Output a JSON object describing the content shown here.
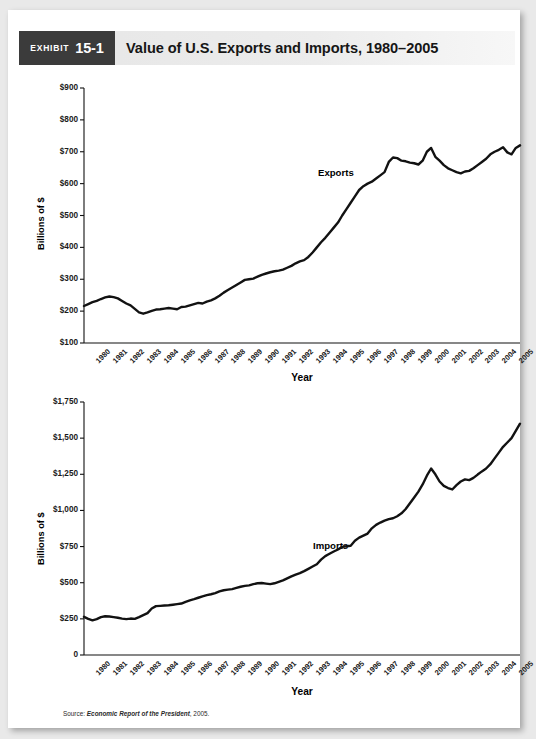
{
  "header": {
    "exhibit_word": "Exhibit",
    "exhibit_number": "15-1",
    "title": "Value of U.S. Exports and Imports, 1980–2005"
  },
  "source": {
    "prefix": "Source:",
    "publication": "Economic Report of the President",
    "suffix": ", 2005."
  },
  "chart_data": [
    {
      "id": "exports",
      "type": "line",
      "title": "Value of U.S. Exports, 1980–2005",
      "xlabel": "Year",
      "ylabel": "Billions of $",
      "series_label": "Exports",
      "ylim": [
        100,
        900
      ],
      "yticks": [
        100,
        200,
        300,
        400,
        500,
        600,
        700,
        800,
        900
      ],
      "ytick_labels": [
        "$100",
        "$200",
        "$300",
        "$400",
        "$500",
        "$600",
        "$700",
        "$800",
        "$900"
      ],
      "xlim": [
        1980,
        2005.75
      ],
      "xticks": [
        1980,
        1981,
        1982,
        1983,
        1984,
        1985,
        1986,
        1987,
        1988,
        1989,
        1990,
        1991,
        1992,
        1993,
        1994,
        1995,
        1996,
        1997,
        1998,
        1999,
        2000,
        2001,
        2002,
        2003,
        2004,
        2005
      ],
      "xtick_labels": [
        "1980",
        "1981",
        "1982",
        "1983",
        "1984",
        "1985",
        "1986",
        "1987",
        "1988",
        "1989",
        "1990",
        "1991",
        "1992",
        "1993",
        "1994",
        "1995",
        "1996",
        "1997",
        "1998",
        "1999",
        "2000",
        "2001",
        "2002",
        "2003",
        "2004",
        "2005"
      ],
      "grid": false,
      "legend": "inline-annotation",
      "x": [
        1980.0,
        1980.25,
        1980.5,
        1980.75,
        1981.0,
        1981.25,
        1981.5,
        1981.75,
        1982.0,
        1982.25,
        1982.5,
        1982.75,
        1983.0,
        1983.25,
        1983.5,
        1983.75,
        1984.0,
        1984.25,
        1984.5,
        1984.75,
        1985.0,
        1985.25,
        1985.5,
        1985.75,
        1986.0,
        1986.25,
        1986.5,
        1986.75,
        1987.0,
        1987.25,
        1987.5,
        1987.75,
        1988.0,
        1988.25,
        1988.5,
        1988.75,
        1989.0,
        1989.25,
        1989.5,
        1989.75,
        1990.0,
        1990.25,
        1990.5,
        1990.75,
        1991.0,
        1991.25,
        1991.5,
        1991.75,
        1992.0,
        1992.25,
        1992.5,
        1992.75,
        1993.0,
        1993.25,
        1993.5,
        1993.75,
        1994.0,
        1994.25,
        1994.5,
        1994.75,
        1995.0,
        1995.25,
        1995.5,
        1995.75,
        1996.0,
        1996.25,
        1996.5,
        1996.75,
        1997.0,
        1997.25,
        1997.5,
        1997.75,
        1998.0,
        1998.25,
        1998.5,
        1998.75,
        1999.0,
        1999.25,
        1999.5,
        1999.75,
        2000.0,
        2000.25,
        2000.5,
        2000.75,
        2001.0,
        2001.25,
        2001.5,
        2001.75,
        2002.0,
        2002.25,
        2002.5,
        2002.75,
        2003.0,
        2003.25,
        2003.5,
        2003.75,
        2004.0,
        2004.25,
        2004.5,
        2004.75,
        2005.0,
        2005.25,
        2005.5,
        2005.75
      ],
      "y": [
        216,
        222,
        228,
        232,
        238,
        243,
        246,
        244,
        240,
        232,
        224,
        218,
        207,
        196,
        192,
        196,
        201,
        205,
        206,
        208,
        210,
        208,
        206,
        213,
        214,
        218,
        222,
        226,
        224,
        230,
        234,
        240,
        248,
        258,
        266,
        274,
        282,
        290,
        298,
        300,
        302,
        308,
        314,
        318,
        322,
        325,
        327,
        330,
        336,
        342,
        350,
        356,
        360,
        370,
        384,
        400,
        416,
        430,
        446,
        462,
        478,
        500,
        520,
        540,
        560,
        580,
        592,
        600,
        606,
        616,
        626,
        636,
        668,
        682,
        680,
        672,
        670,
        666,
        664,
        660,
        672,
        700,
        712,
        684,
        672,
        658,
        648,
        642,
        636,
        632,
        638,
        640,
        648,
        658,
        668,
        678,
        692,
        700,
        706,
        714,
        698,
        692,
        712,
        720
      ],
      "note": "values are approximate quarterly readings in billions of dollars"
    },
    {
      "id": "imports",
      "type": "line",
      "title": "Value of U.S. Imports, 1980–2005",
      "xlabel": "Year",
      "ylabel": "Billions of $",
      "series_label": "Imports",
      "ylim": [
        0,
        1750
      ],
      "yticks": [
        0,
        250,
        500,
        750,
        1000,
        1250,
        1500,
        1750
      ],
      "ytick_labels": [
        "0",
        "$250",
        "$500",
        "$750",
        "$1,000",
        "$1,250",
        "$1,500",
        "$1,750"
      ],
      "xlim": [
        1980,
        2005.75
      ],
      "xticks": [
        1980,
        1981,
        1982,
        1983,
        1984,
        1985,
        1986,
        1987,
        1988,
        1989,
        1990,
        1991,
        1992,
        1993,
        1994,
        1995,
        1996,
        1997,
        1998,
        1999,
        2000,
        2001,
        2002,
        2003,
        2004,
        2005
      ],
      "xtick_labels": [
        "1980",
        "1981",
        "1982",
        "1983",
        "1984",
        "1985",
        "1986",
        "1987",
        "1988",
        "1989",
        "1990",
        "1991",
        "1992",
        "1993",
        "1994",
        "1995",
        "1996",
        "1997",
        "1998",
        "1999",
        "2000",
        "2001",
        "2002",
        "2003",
        "2004",
        "2005"
      ],
      "grid": false,
      "legend": "inline-annotation",
      "x": [
        1980.0,
        1980.25,
        1980.5,
        1980.75,
        1981.0,
        1981.25,
        1981.5,
        1981.75,
        1982.0,
        1982.25,
        1982.5,
        1982.75,
        1983.0,
        1983.25,
        1983.5,
        1983.75,
        1984.0,
        1984.25,
        1984.5,
        1984.75,
        1985.0,
        1985.25,
        1985.5,
        1985.75,
        1986.0,
        1986.25,
        1986.5,
        1986.75,
        1987.0,
        1987.25,
        1987.5,
        1987.75,
        1988.0,
        1988.25,
        1988.5,
        1988.75,
        1989.0,
        1989.25,
        1989.5,
        1989.75,
        1990.0,
        1990.25,
        1990.5,
        1990.75,
        1991.0,
        1991.25,
        1991.5,
        1991.75,
        1992.0,
        1992.25,
        1992.5,
        1992.75,
        1993.0,
        1993.25,
        1993.5,
        1993.75,
        1994.0,
        1994.25,
        1994.5,
        1994.75,
        1995.0,
        1995.25,
        1995.5,
        1995.75,
        1996.0,
        1996.25,
        1996.5,
        1996.75,
        1997.0,
        1997.25,
        1997.5,
        1997.75,
        1998.0,
        1998.25,
        1998.5,
        1998.75,
        1999.0,
        1999.25,
        1999.5,
        1999.75,
        2000.0,
        2000.25,
        2000.5,
        2000.75,
        2001.0,
        2001.25,
        2001.5,
        2001.75,
        2002.0,
        2002.25,
        2002.5,
        2002.75,
        2003.0,
        2003.25,
        2003.5,
        2003.75,
        2004.0,
        2004.25,
        2004.5,
        2004.75,
        2005.0,
        2005.25,
        2005.5,
        2005.75
      ],
      "y": [
        264,
        250,
        240,
        248,
        262,
        268,
        266,
        262,
        258,
        252,
        248,
        252,
        250,
        262,
        276,
        290,
        322,
        338,
        340,
        342,
        344,
        348,
        352,
        356,
        368,
        378,
        386,
        396,
        406,
        414,
        420,
        428,
        440,
        448,
        452,
        456,
        464,
        472,
        478,
        482,
        490,
        496,
        498,
        494,
        490,
        496,
        506,
        516,
        530,
        544,
        556,
        566,
        580,
        596,
        612,
        628,
        660,
        684,
        700,
        716,
        730,
        748,
        752,
        756,
        790,
        812,
        826,
        840,
        876,
        900,
        916,
        930,
        940,
        946,
        960,
        980,
        1010,
        1050,
        1090,
        1130,
        1180,
        1240,
        1290,
        1250,
        1200,
        1170,
        1155,
        1145,
        1175,
        1200,
        1215,
        1210,
        1225,
        1248,
        1270,
        1290,
        1320,
        1360,
        1400,
        1440,
        1470,
        1500,
        1550,
        1600
      ],
      "note": "values are approximate quarterly readings in billions of dollars"
    }
  ]
}
